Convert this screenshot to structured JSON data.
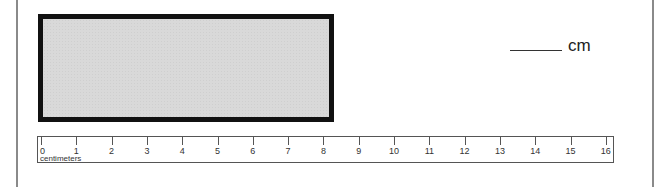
{
  "worksheet": {
    "answer": {
      "blank": "",
      "unit": "cm"
    },
    "rectangle": {
      "fill": "#d9d9d9",
      "border": "#111111"
    },
    "ruler": {
      "unit_label": "centimeters",
      "ticks": [
        "0",
        "1",
        "2",
        "3",
        "4",
        "5",
        "6",
        "7",
        "8",
        "9",
        "10",
        "11",
        "12",
        "13",
        "14",
        "15",
        "16"
      ]
    }
  }
}
